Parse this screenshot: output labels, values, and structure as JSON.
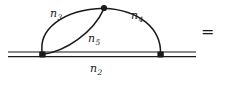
{
  "figure": {
    "kind": "feynman-diagram",
    "background_color": "#ffffff",
    "ink_color": "#1a1a1a",
    "equals_sign": "=",
    "labels": {
      "n2": {
        "base": "n",
        "subscript": "2"
      },
      "n3": {
        "base": "n",
        "subscript": "3"
      },
      "n4": {
        "base": "n",
        "subscript": "4"
      },
      "n5": {
        "base": "n",
        "subscript": "5"
      }
    },
    "vertices": [
      {
        "name": "left-vertex",
        "x": 42,
        "y": 54
      },
      {
        "name": "top-vertex",
        "x": 104,
        "y": 8
      },
      {
        "name": "right-vertex",
        "x": 160,
        "y": 54
      }
    ],
    "double_line": {
      "name": "n2-eikonal-line",
      "x_start": 8,
      "x_end": 196,
      "y_upper": 52,
      "y_lower": 56.5
    },
    "arcs": [
      {
        "name": "n3-arc",
        "from": "left-vertex",
        "to": "top-vertex",
        "bulge": "upper-left"
      },
      {
        "name": "n5-arc",
        "from": "left-vertex",
        "to": "top-vertex",
        "bulge": "lower-right"
      },
      {
        "name": "n4-arc",
        "from": "top-vertex",
        "to": "right-vertex",
        "bulge": "upper-right"
      }
    ]
  }
}
